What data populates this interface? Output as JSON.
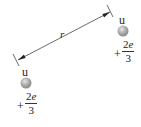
{
  "diagram": {
    "distance_label": "r",
    "particles": [
      {
        "name": "u",
        "charge_sign": "+",
        "charge_numerator": "2",
        "charge_numerator_var": "e",
        "charge_denominator": "3",
        "position": "lower-left"
      },
      {
        "name": "u",
        "charge_sign": "+",
        "charge_numerator": "2",
        "charge_numerator_var": "e",
        "charge_denominator": "3",
        "position": "upper-right"
      }
    ],
    "colors": {
      "sphere": "#a8a8a8",
      "line": "#333333"
    }
  }
}
